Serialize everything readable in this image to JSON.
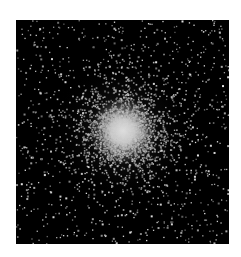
{
  "image": {
    "subject": "globular star cluster",
    "background_color": "#ffffff",
    "sky_color": "#000000",
    "star_color": "#d8d8d8",
    "core_color": "#f2f2f2",
    "frame": {
      "x": 16,
      "y": 20,
      "width": 213,
      "height": 224
    },
    "core_center": {
      "x": 107,
      "y": 111
    },
    "core_radius": 14,
    "halo_radius": 60,
    "field_star_count": 900,
    "cluster_star_count": 3200,
    "seed": 7
  }
}
